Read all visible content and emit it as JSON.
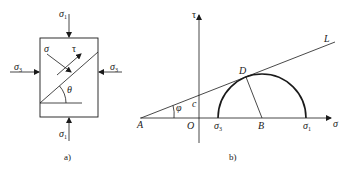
{
  "panel_a": {
    "caption": "a)",
    "labels": {
      "sigma1_top": "σ",
      "sigma1_top_sub": "1",
      "sigma1_bottom": "σ",
      "sigma1_bottom_sub": "1",
      "sigma3_left": "σ",
      "sigma3_left_sub": "3",
      "sigma3_right": "σ",
      "sigma3_right_sub": "3",
      "normal_stress": "σ",
      "shear_stress": "τ",
      "angle": "θ"
    }
  },
  "panel_b": {
    "caption": "b)",
    "labels": {
      "tau_axis": "τ",
      "sigma_axis": "σ",
      "point_A": "A",
      "origin": "O",
      "sigma3": "σ",
      "sigma3_sub": "3",
      "point_B": "B",
      "sigma1": "σ",
      "sigma1_sub": "1",
      "point_D": "D",
      "line_L": "L",
      "cohesion": "c",
      "friction_angle": "φ"
    }
  },
  "colors": {
    "line": "#1a1a1a",
    "background": "#ffffff"
  }
}
